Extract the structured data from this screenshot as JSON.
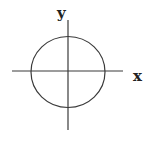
{
  "diagram": {
    "type": "coordinate-axes-with-circle",
    "x_axis": {
      "label": "x",
      "x1": 12,
      "x2": 123,
      "y": 71
    },
    "y_axis": {
      "label": "y",
      "x": 68,
      "y1": 20,
      "y2": 130
    },
    "circle": {
      "cx": 68,
      "cy": 72,
      "rx": 37,
      "ry": 35.5
    },
    "labels": {
      "x": {
        "text": "x",
        "x": 133,
        "y": 81
      },
      "y": {
        "text": "y",
        "x": 57,
        "y": 18
      }
    },
    "colors": {
      "stroke": "#3a3a3a",
      "label": "#222222",
      "background": "#ffffff"
    }
  }
}
